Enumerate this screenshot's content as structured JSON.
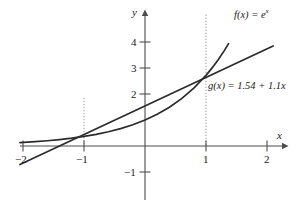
{
  "chart_data": {
    "type": "line",
    "title": "",
    "xlabel": "x",
    "ylabel": "y",
    "xlim": [
      -2.1,
      2.25
    ],
    "ylim": [
      -1.55,
      4.9
    ],
    "xticks": [
      -2,
      -1,
      1,
      2
    ],
    "xtick_labels": [
      "−2",
      "−1",
      "1",
      "2"
    ],
    "yticks": [
      4,
      3,
      2,
      -1
    ],
    "ytick_labels": [
      "4",
      "3",
      "2",
      "−1"
    ],
    "grid": false,
    "legend_position": "inline-annotation",
    "series": [
      {
        "name": "f",
        "label": "f(x) = e^x",
        "label_base": "f(x) = e",
        "label_exponent": "x",
        "kind": "exponential",
        "color": "#2b2b2b",
        "x_start": -2.05,
        "x_end": 1.37,
        "points_x": [
          -2.05,
          -1.8,
          -1.6,
          -1.4,
          -1.2,
          -1.0,
          -0.8,
          -0.6,
          -0.4,
          -0.2,
          0.0,
          0.2,
          0.4,
          0.6,
          0.8,
          1.0,
          1.1,
          1.2,
          1.3,
          1.37
        ],
        "points_y": [
          0.129,
          0.165,
          0.202,
          0.247,
          0.301,
          0.368,
          0.449,
          0.549,
          0.67,
          0.819,
          1.0,
          1.221,
          1.492,
          1.822,
          2.226,
          2.718,
          3.004,
          3.32,
          3.669,
          3.937
        ]
      },
      {
        "name": "g",
        "label": "g(x) = 1.54 + 1.1x",
        "kind": "linear",
        "intercept": 1.54,
        "slope": 1.1,
        "color": "#2b2b2b",
        "x_start": -2.05,
        "x_end": 2.1,
        "y_start": -0.715,
        "y_end": 3.85
      }
    ],
    "dotted_guides": [
      {
        "x": -1,
        "y_top": 1.85,
        "y_bottom": 0
      },
      {
        "x": 1,
        "y_top": 5.05,
        "y_bottom": 0
      }
    ],
    "axis_color": "#4d4d4d",
    "curve_color": "#2b2b2b",
    "guide_color": "#8c8c8c",
    "background": "#ffffff"
  },
  "labels": {
    "x_axis": "x",
    "y_axis": "y",
    "f_label_base": "f(x) = e",
    "f_label_exp": "x",
    "g_label": "g(x) = 1.54 + 1.1x",
    "xtick_neg2": "−2",
    "xtick_neg1": "−1",
    "xtick_1": "1",
    "xtick_2": "2",
    "ytick_4": "4",
    "ytick_3": "3",
    "ytick_2": "2",
    "ytick_neg1": "−1"
  }
}
